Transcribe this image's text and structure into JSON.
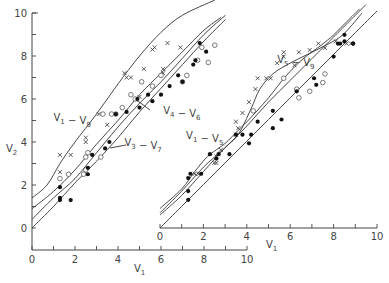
{
  "chart_data": [
    {
      "id": "left",
      "type": "scatter",
      "title": "",
      "xlabel": "V1",
      "ylabel": "V2",
      "xlim": [
        0,
        10
      ],
      "ylim": [
        -1,
        10
      ],
      "x_ticks": [
        0,
        2,
        4,
        6,
        8,
        10
      ],
      "y_ticks": [
        0,
        2,
        4,
        6,
        8,
        10
      ],
      "grid": false,
      "origin_px": [
        32,
        228
      ],
      "scale_px": 21.5,
      "curves": [
        {
          "name": "V1 - V9",
          "label_pos": [
            1.0,
            5.0
          ],
          "points": [
            [
              0,
              1.4
            ],
            [
              0.7,
              2.0
            ],
            [
              1.3,
              3.0
            ],
            [
              2.0,
              4.0
            ],
            [
              3.0,
              5.3
            ],
            [
              4.0,
              6.7
            ],
            [
              5.0,
              8.0
            ],
            [
              6.0,
              9.1
            ],
            [
              7.0,
              9.9
            ],
            [
              8.5,
              10.6
            ]
          ]
        },
        {
          "name": "V3 - V7",
          "label_pos": [
            4.3,
            3.8
          ],
          "points": [
            [
              0,
              0.9
            ],
            [
              1.0,
              1.7
            ],
            [
              2.0,
              2.7
            ],
            [
              3.0,
              3.9
            ],
            [
              4.0,
              5.0
            ],
            [
              5.0,
              6.2
            ],
            [
              6.0,
              7.2
            ],
            [
              7.0,
              8.2
            ],
            [
              8.0,
              9.2
            ],
            [
              8.8,
              9.8
            ]
          ]
        },
        {
          "name": "V4 - V6",
          "label_pos": [
            6.1,
            5.3
          ],
          "points": [
            [
              0,
              0.4
            ],
            [
              1.0,
              1.4
            ],
            [
              2.0,
              2.3
            ],
            [
              3.0,
              3.5
            ],
            [
              4.0,
              4.7
            ],
            [
              5.0,
              5.8
            ],
            [
              6.0,
              6.8
            ],
            [
              7.0,
              7.9
            ],
            [
              8.0,
              9.0
            ],
            [
              9.0,
              9.9
            ]
          ]
        },
        {
          "name": "V1 - V5 baseline",
          "label_pos": null,
          "points": [
            [
              0,
              0
            ],
            [
              1.0,
              1.0
            ],
            [
              2.0,
              2.1
            ],
            [
              3.0,
              3.1
            ],
            [
              4.0,
              4.2
            ],
            [
              5.0,
              5.4
            ],
            [
              6.0,
              6.5
            ],
            [
              7.0,
              7.6
            ],
            [
              8.0,
              8.7
            ],
            [
              9.0,
              9.7
            ]
          ]
        }
      ],
      "series": [
        {
          "name": "x",
          "marker": "x",
          "points": [
            [
              1.3,
              3.4
            ],
            [
              1.8,
              3.4
            ],
            [
              1.3,
              2.6
            ],
            [
              2.5,
              4.2
            ],
            [
              2.5,
              4.0
            ],
            [
              3.1,
              5.3
            ],
            [
              3.5,
              4.8
            ],
            [
              4.4,
              7.0
            ],
            [
              4.3,
              7.2
            ],
            [
              4.6,
              7.0
            ],
            [
              5.2,
              7.4
            ],
            [
              5.6,
              8.3
            ],
            [
              5.7,
              8.4
            ],
            [
              6.1,
              7.4
            ],
            [
              6.1,
              7.2
            ],
            [
              6.9,
              8.4
            ],
            [
              5.0,
              6.1
            ],
            [
              6.3,
              8.6
            ]
          ]
        },
        {
          "name": "o",
          "marker": "o",
          "points": [
            [
              1.3,
              2.3
            ],
            [
              1.7,
              2.5
            ],
            [
              2.4,
              2.5
            ],
            [
              2.5,
              2.7
            ],
            [
              2.5,
              3.3
            ],
            [
              2.6,
              3.5
            ],
            [
              3.2,
              3.3
            ],
            [
              3.3,
              5.3
            ],
            [
              3.7,
              5.3
            ],
            [
              3.9,
              5.3
            ],
            [
              4.2,
              5.6
            ],
            [
              4.6,
              6.2
            ],
            [
              4.8,
              6.0
            ],
            [
              5.1,
              6.8
            ],
            [
              5.6,
              6.6
            ],
            [
              6.0,
              7.1
            ],
            [
              7.0,
              6.8
            ],
            [
              7.2,
              7.1
            ],
            [
              7.7,
              7.8
            ],
            [
              8.2,
              7.7
            ],
            [
              8.5,
              8.5
            ],
            [
              7.9,
              8.4
            ]
          ]
        },
        {
          "name": "filled",
          "marker": "dot",
          "points": [
            [
              1.3,
              1.9
            ],
            [
              1.3,
              1.4
            ],
            [
              1.3,
              1.3
            ],
            [
              1.8,
              1.3
            ],
            [
              2.6,
              2.5
            ],
            [
              2.6,
              2.8
            ],
            [
              2.8,
              3.4
            ],
            [
              3.4,
              3.7
            ],
            [
              3.6,
              4.0
            ],
            [
              3.9,
              5.3
            ],
            [
              4.4,
              5.4
            ],
            [
              4.9,
              6.0
            ],
            [
              5.0,
              5.6
            ],
            [
              5.4,
              6.2
            ],
            [
              5.6,
              5.9
            ],
            [
              6.0,
              6.2
            ],
            [
              6.4,
              6.6
            ],
            [
              6.8,
              7.1
            ],
            [
              7.0,
              6.8
            ],
            [
              7.5,
              7.6
            ],
            [
              7.6,
              7.8
            ],
            [
              7.8,
              8.6
            ],
            [
              8.1,
              8.2
            ]
          ]
        }
      ]
    },
    {
      "id": "right",
      "type": "scatter",
      "title": "",
      "xlabel": "V1",
      "ylabel": "",
      "xlim": [
        0,
        10
      ],
      "ylim": [
        0,
        10
      ],
      "x_ticks": [
        0,
        2,
        4,
        6,
        8,
        10
      ],
      "grid": false,
      "origin_px": [
        160,
        228
      ],
      "scale_px": 21.7,
      "curves": [
        {
          "name": "V5 - V9",
          "label_pos": [
            5.4,
            7.6
          ],
          "points": [
            [
              0,
              0.6
            ],
            [
              1.0,
              1.5
            ],
            [
              2.0,
              2.6
            ],
            [
              3.0,
              3.7
            ],
            [
              3.6,
              4.3
            ],
            [
              4.2,
              5.5
            ],
            [
              4.6,
              6.4
            ],
            [
              5.2,
              7.1
            ],
            [
              6.0,
              7.6
            ],
            [
              6.8,
              8.0
            ],
            [
              7.6,
              8.4
            ],
            [
              8.3,
              8.8
            ],
            [
              8.8,
              9.3
            ],
            [
              9.3,
              9.9
            ]
          ]
        },
        {
          "name": "V1 - V5",
          "label_pos": [
            1.2,
            4.1
          ],
          "points": [
            [
              0,
              0.9
            ],
            [
              1.0,
              1.8
            ],
            [
              1.6,
              2.6
            ],
            [
              2.2,
              3.3
            ],
            [
              3.0,
              3.9
            ],
            [
              3.6,
              4.5
            ],
            [
              4.2,
              5.1
            ],
            [
              5.0,
              6.0
            ],
            [
              5.8,
              7.0
            ],
            [
              6.6,
              7.8
            ],
            [
              7.4,
              8.4
            ],
            [
              8.0,
              8.9
            ],
            [
              8.6,
              9.5
            ],
            [
              9.2,
              10.1
            ]
          ]
        },
        {
          "name": "middle",
          "label_pos": null,
          "points": [
            [
              0,
              0.7
            ],
            [
              1.0,
              1.7
            ],
            [
              2.0,
              2.8
            ],
            [
              3.0,
              3.7
            ],
            [
              4.0,
              4.7
            ],
            [
              5.0,
              5.8
            ],
            [
              6.0,
              6.8
            ],
            [
              7.0,
              7.8
            ],
            [
              8.0,
              8.8
            ],
            [
              8.8,
              9.6
            ],
            [
              9.5,
              10.3
            ]
          ]
        },
        {
          "name": "baseline",
          "label_pos": null,
          "points": [
            [
              0,
              0
            ],
            [
              1.0,
              1.0
            ],
            [
              2.0,
              2.0
            ],
            [
              3.0,
              3.0
            ],
            [
              4.0,
              4.0
            ],
            [
              5.0,
              5.0
            ],
            [
              6.0,
              6.0
            ],
            [
              7.0,
              7.0
            ],
            [
              8.0,
              8.0
            ],
            [
              9.0,
              9.0
            ],
            [
              10.0,
              10.0
            ]
          ]
        }
      ],
      "series": [
        {
          "name": "x",
          "marker": "x",
          "points": [
            [
              1.8,
              2.5
            ],
            [
              1.6,
              2.5
            ],
            [
              2.5,
              3.0
            ],
            [
              2.6,
              3.0
            ],
            [
              2.6,
              3.3
            ],
            [
              2.8,
              3.6
            ],
            [
              3.5,
              4.3
            ],
            [
              3.6,
              4.6
            ],
            [
              3.5,
              4.9
            ],
            [
              3.8,
              5.3
            ],
            [
              4.1,
              5.8
            ],
            [
              4.4,
              6.4
            ],
            [
              4.5,
              6.9
            ],
            [
              4.9,
              6.9
            ],
            [
              5.1,
              6.9
            ],
            [
              5.4,
              7.6
            ],
            [
              5.7,
              7.9
            ],
            [
              5.7,
              8.1
            ],
            [
              6.4,
              8.1
            ],
            [
              6.2,
              7.5
            ],
            [
              6.9,
              8.2
            ],
            [
              7.3,
              8.5
            ],
            [
              7.6,
              8.3
            ],
            [
              8.1,
              8.6
            ],
            [
              8.6,
              8.5
            ],
            [
              8.8,
              8.5
            ]
          ]
        },
        {
          "name": "o",
          "marker": "o",
          "points": [
            [
              4.3,
              5.4
            ],
            [
              5.7,
              6.9
            ],
            [
              6.3,
              6.4
            ],
            [
              6.9,
              6.3
            ],
            [
              7.5,
              6.7
            ],
            [
              7.6,
              7.1
            ],
            [
              6.4,
              6.0
            ]
          ]
        },
        {
          "name": "filled",
          "marker": "dot",
          "points": [
            [
              1.3,
              1.3
            ],
            [
              1.3,
              1.7
            ],
            [
              1.3,
              2.3
            ],
            [
              1.4,
              2.5
            ],
            [
              1.9,
              2.5
            ],
            [
              2.3,
              3.4
            ],
            [
              2.6,
              3.2
            ],
            [
              2.7,
              3.4
            ],
            [
              3.2,
              3.4
            ],
            [
              3.5,
              4.3
            ],
            [
              3.8,
              4.3
            ],
            [
              4.2,
              4.3
            ],
            [
              4.1,
              3.9
            ],
            [
              4.5,
              4.9
            ],
            [
              5.2,
              4.6
            ],
            [
              5.2,
              5.4
            ],
            [
              5.6,
              5.0
            ],
            [
              6.3,
              6.3
            ],
            [
              7.2,
              6.6
            ],
            [
              7.1,
              6.9
            ],
            [
              8.0,
              7.9
            ],
            [
              8.2,
              8.5
            ],
            [
              8.3,
              8.5
            ],
            [
              8.5,
              8.9
            ],
            [
              8.5,
              8.6
            ],
            [
              8.9,
              8.5
            ],
            [
              8.9,
              8.5
            ]
          ]
        }
      ]
    }
  ],
  "labels": {
    "left_ylabel_main": "V",
    "left_ylabel_sub": "2",
    "left_xlabel_main": "V",
    "left_xlabel_sub": "1",
    "right_xlabel_main": "V",
    "right_xlabel_sub": "1"
  }
}
